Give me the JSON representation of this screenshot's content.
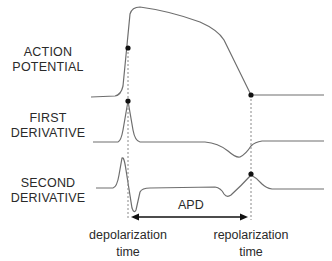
{
  "rows": [
    {
      "id": "action-potential",
      "label_line1": "ACTION",
      "label_line2": "POTENTIAL"
    },
    {
      "id": "first-derivative",
      "label_line1": "FIRST",
      "label_line2": "DERIVATIVE"
    },
    {
      "id": "second-derivative",
      "label_line1": "SECOND",
      "label_line2": "DERIVATIVE"
    }
  ],
  "interval": {
    "label": "APD"
  },
  "markers": {
    "depolarization": {
      "line1": "depolarization",
      "line2": "time"
    },
    "repolarization": {
      "line1": "repolarization",
      "line2": "time"
    }
  },
  "colors": {
    "trace": "#6e6e6e",
    "marker": "#111111",
    "dashed": "#8a8a8a",
    "arrow": "#111111"
  }
}
